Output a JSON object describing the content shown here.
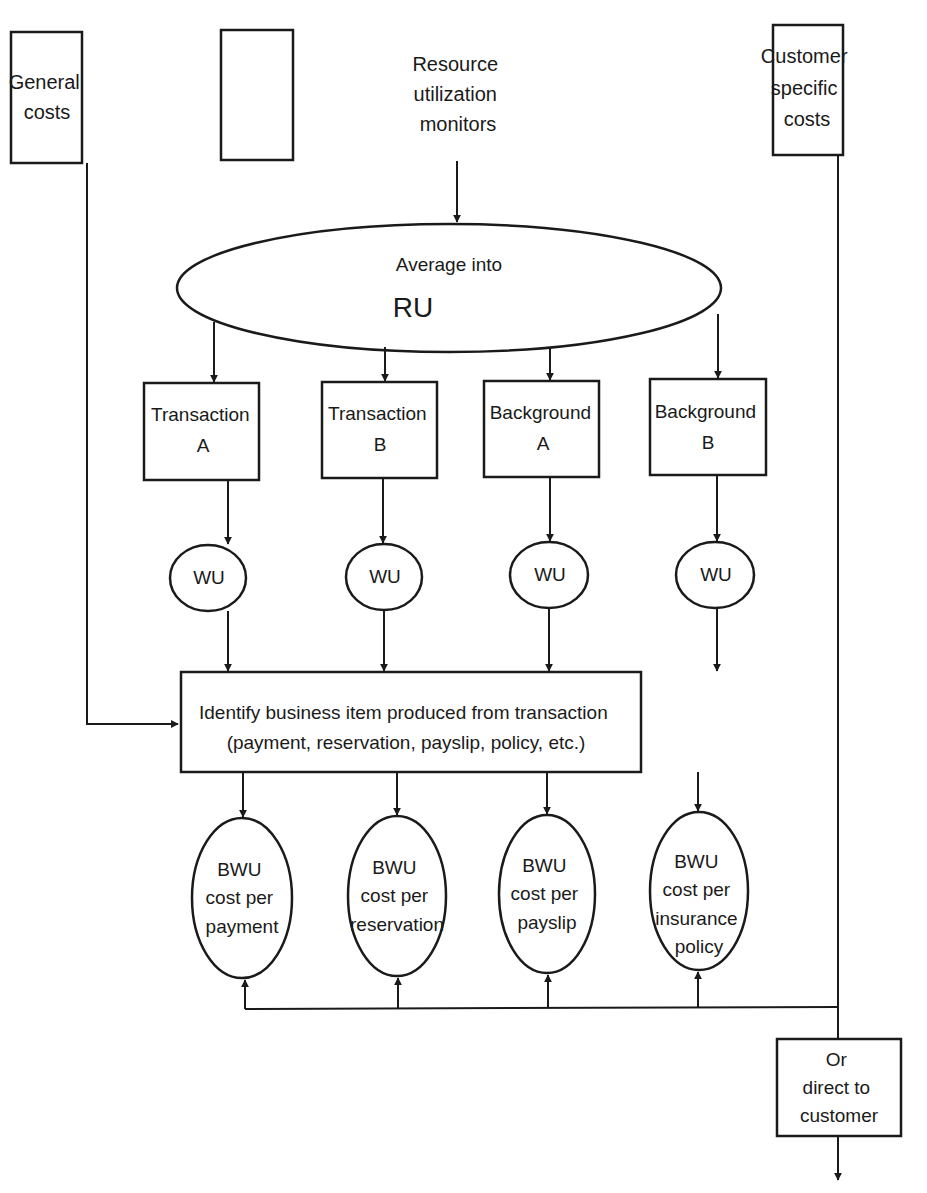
{
  "diagram": {
    "sources": {
      "general_costs": {
        "lines": [
          "General",
          "costs"
        ]
      },
      "resource_monitors": {
        "lines": [
          "Resource",
          "utilization",
          "monitors"
        ]
      },
      "customer_costs": {
        "lines": [
          "Customer",
          "specific",
          "costs"
        ]
      }
    },
    "average": {
      "line1": "Average into",
      "line2": "RU"
    },
    "workloads": [
      {
        "lines": [
          "Transaction",
          "A"
        ],
        "unit": "WU"
      },
      {
        "lines": [
          "Transaction",
          "B"
        ],
        "unit": "WU"
      },
      {
        "lines": [
          "Background",
          "A"
        ],
        "unit": "WU"
      },
      {
        "lines": [
          "Background",
          "B"
        ],
        "unit": "WU"
      }
    ],
    "identify": {
      "line1": "Identify business item produced from transaction",
      "line2": "(payment, reservation, payslip, policy, etc.)"
    },
    "bwu": [
      {
        "lines": [
          "BWU",
          "cost per",
          "payment"
        ]
      },
      {
        "lines": [
          "BWU",
          "cost per",
          "reservation"
        ]
      },
      {
        "lines": [
          "BWU",
          "cost per",
          "payslip"
        ]
      },
      {
        "lines": [
          "BWU",
          "cost per",
          "insurance",
          "policy"
        ]
      }
    ],
    "direct": {
      "lines": [
        "Or",
        "direct to",
        "customer"
      ]
    },
    "colors": {
      "stroke": "#1a1a1a",
      "background": "#ffffff"
    }
  }
}
